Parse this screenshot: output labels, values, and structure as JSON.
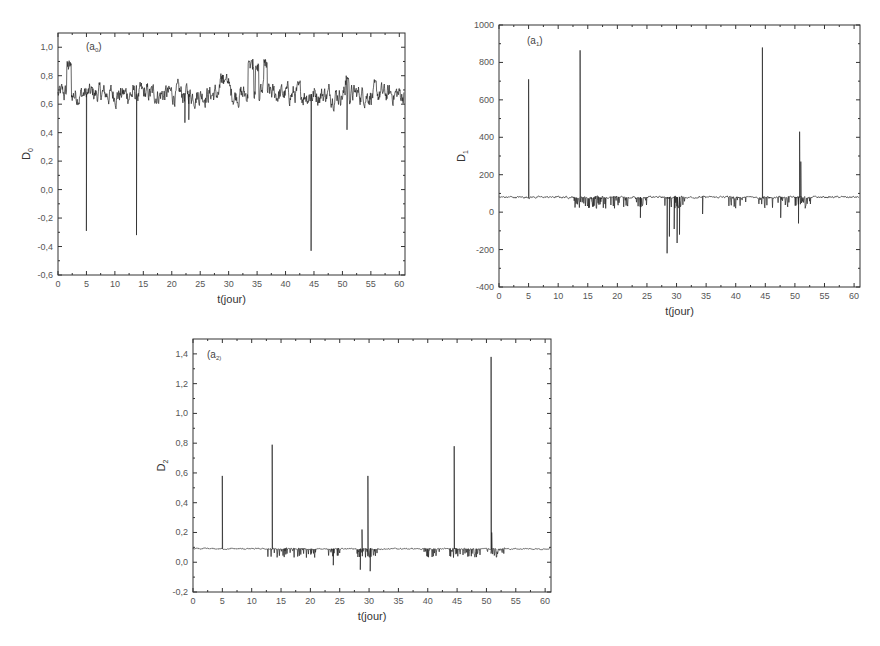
{
  "chart_data": [
    {
      "id": "a0",
      "type": "line",
      "panel_label": "(a",
      "panel_sub": "0",
      "title": "",
      "xlabel": "t(jour)",
      "ylabel": "D",
      "ylabel_sub": "0",
      "xlim": [
        0,
        61
      ],
      "ylim": [
        -0.6,
        1.1
      ],
      "xticks": [
        0,
        5,
        10,
        15,
        20,
        25,
        30,
        35,
        40,
        45,
        50,
        55,
        60
      ],
      "yticks": [
        -0.6,
        -0.4,
        -0.2,
        0.0,
        0.2,
        0.4,
        0.6,
        0.8,
        1.0
      ],
      "ytick_labels": [
        "-0,6",
        "-0,4",
        "-0,2",
        "0,0",
        "0,2",
        "0,4",
        "0,6",
        "0,8",
        "1,0"
      ],
      "grid": false,
      "frame": {
        "left": 58,
        "top": 33,
        "right": 405,
        "bottom": 275
      },
      "baseline": 0.67,
      "noise": 0.05,
      "features": [
        {
          "x": 1.5,
          "x2": 2.3,
          "y": 0.87,
          "kind": "plateau"
        },
        {
          "x": 5.0,
          "y": -0.29,
          "kind": "spike"
        },
        {
          "x": 13.8,
          "y": -0.32,
          "kind": "spike"
        },
        {
          "x": 28.5,
          "x2": 30.0,
          "y": 0.78,
          "kind": "plateau"
        },
        {
          "x": 33.4,
          "x2": 34.4,
          "y": 0.88,
          "kind": "plateau"
        },
        {
          "x": 34.7,
          "x2": 35.3,
          "y": 0.86,
          "kind": "plateau"
        },
        {
          "x": 36.2,
          "x2": 36.8,
          "y": 0.88,
          "kind": "plateau"
        },
        {
          "x": 22.3,
          "y": 0.47,
          "kind": "spike"
        },
        {
          "x": 23.0,
          "y": 0.49,
          "kind": "spike"
        },
        {
          "x": 44.5,
          "y": -0.43,
          "kind": "spike"
        },
        {
          "x": 50.8,
          "y": 0.42,
          "kind": "spike"
        },
        {
          "x": 50.5,
          "x2": 51.2,
          "y": 0.77,
          "kind": "plateau"
        }
      ]
    },
    {
      "id": "a1",
      "type": "line",
      "panel_label": "(a",
      "panel_sub": "1",
      "title": "",
      "xlabel": "t(jour)",
      "ylabel": "D",
      "ylabel_sub": "1",
      "xlim": [
        0,
        61
      ],
      "ylim": [
        -400,
        1000
      ],
      "xticks": [
        0,
        5,
        10,
        15,
        20,
        25,
        30,
        35,
        40,
        45,
        50,
        55,
        60
      ],
      "yticks": [
        -400,
        -200,
        0,
        200,
        400,
        600,
        800,
        1000
      ],
      "ytick_labels": [
        "-400",
        "-200",
        "0",
        "200",
        "400",
        "600",
        "800",
        "1000"
      ],
      "grid": false,
      "frame": {
        "left": 499,
        "top": 25,
        "right": 860,
        "bottom": 287
      },
      "baseline": 80,
      "noise": 4,
      "features": [
        {
          "x": 5.0,
          "y": 710,
          "kind": "spike"
        },
        {
          "x": 13.7,
          "y": 865,
          "kind": "spike"
        },
        {
          "x": 28.4,
          "y": -220,
          "kind": "spike"
        },
        {
          "x": 28.8,
          "y": -130,
          "kind": "spike"
        },
        {
          "x": 29.6,
          "y": -90,
          "kind": "spike"
        },
        {
          "x": 30.1,
          "y": -165,
          "kind": "spike"
        },
        {
          "x": 30.5,
          "y": -120,
          "kind": "spike"
        },
        {
          "x": 44.5,
          "y": 880,
          "kind": "spike"
        },
        {
          "x": 50.8,
          "y": 430,
          "kind": "spike"
        },
        {
          "x": 51.0,
          "y": 270,
          "kind": "spike"
        },
        {
          "x": 50.6,
          "y": -60,
          "kind": "spike"
        },
        {
          "x": 23.9,
          "y": -30,
          "kind": "spike"
        },
        {
          "x": 34.4,
          "y": -10,
          "kind": "spike"
        },
        {
          "x": 47.6,
          "y": -30,
          "kind": "spike"
        }
      ],
      "dip_regions": [
        [
          12.6,
          22.0
        ],
        [
          23.0,
          25.0
        ],
        [
          27.8,
          31.5
        ],
        [
          38.8,
          42.0
        ],
        [
          43.6,
          49.0
        ],
        [
          50.0,
          53.0
        ]
      ],
      "dip_depth": 60
    },
    {
      "id": "a2",
      "type": "line",
      "panel_label": "(a",
      "panel_sub": "2)",
      "title": "",
      "xlabel": "t(jour)",
      "ylabel": "D",
      "ylabel_sub": "2",
      "xlim": [
        0,
        61
      ],
      "ylim": [
        -0.2,
        1.5
      ],
      "xticks": [
        0,
        5,
        10,
        15,
        20,
        25,
        30,
        35,
        40,
        45,
        50,
        55,
        60
      ],
      "yticks": [
        -0.2,
        0.0,
        0.2,
        0.4,
        0.6,
        0.8,
        1.0,
        1.2,
        1.4
      ],
      "ytick_labels": [
        "-0,2",
        "0,0",
        "0,2",
        "0,4",
        "0,6",
        "0,8",
        "1,0",
        "1,2",
        "1,4"
      ],
      "grid": false,
      "frame": {
        "left": 193,
        "top": 339,
        "right": 551,
        "bottom": 592
      },
      "baseline": 0.09,
      "noise": 0.003,
      "features": [
        {
          "x": 5.0,
          "y": 0.58,
          "kind": "spike"
        },
        {
          "x": 13.5,
          "y": 0.79,
          "kind": "spike"
        },
        {
          "x": 28.8,
          "y": 0.22,
          "kind": "spike"
        },
        {
          "x": 29.8,
          "y": 0.58,
          "kind": "spike"
        },
        {
          "x": 28.5,
          "y": -0.05,
          "kind": "spike"
        },
        {
          "x": 30.2,
          "y": -0.06,
          "kind": "spike"
        },
        {
          "x": 44.5,
          "y": 0.78,
          "kind": "spike"
        },
        {
          "x": 50.8,
          "y": 1.38,
          "kind": "spike"
        },
        {
          "x": 50.9,
          "y": 0.2,
          "kind": "spike"
        },
        {
          "x": 23.9,
          "y": -0.02,
          "kind": "spike"
        }
      ],
      "dip_regions": [
        [
          12.6,
          22.0
        ],
        [
          23.0,
          25.0
        ],
        [
          27.8,
          31.5
        ],
        [
          38.8,
          42.0
        ],
        [
          43.6,
          49.0
        ],
        [
          50.0,
          53.0
        ]
      ],
      "dip_depth": 0.06
    }
  ]
}
